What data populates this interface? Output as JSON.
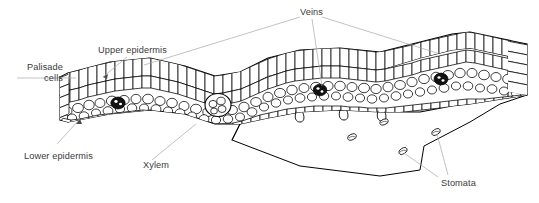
{
  "figure": {
    "background_color": "#ffffff",
    "line_color": "#000000",
    "leader_color": "#a8a8a8",
    "text_color": "#3b3b3b"
  },
  "labels": {
    "palisade_cells_line1": "Palisade",
    "palisade_cells_line2": "cells",
    "upper_epidermis": "Upper epidermis",
    "veins": "Veins",
    "lower_epidermis": "Lower epidermis",
    "xylem": "Xylem",
    "stomata": "Stomata"
  },
  "structures": {
    "vein_bundle_count": 3,
    "xylem_bundle_count": 1,
    "stomata_pore_count": 4,
    "guard_cell_pairs": 3,
    "tissue_layers": [
      "upper epidermis",
      "palisade cells",
      "spongy mesophyll",
      "lower epidermis"
    ]
  }
}
